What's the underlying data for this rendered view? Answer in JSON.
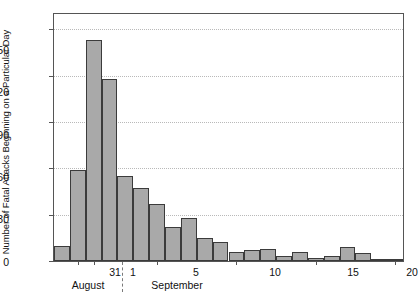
{
  "chart_data": {
    "type": "bar",
    "title": "",
    "subtitle": "",
    "xlabel": "",
    "ylabel": "Number of Fatal Attacks Beginning on a Particular Day",
    "ylim": [
      0,
      160
    ],
    "xlim": [
      0,
      21
    ],
    "grid": true,
    "legend": null,
    "yticks": [
      0,
      30,
      60,
      90,
      120,
      150
    ],
    "ytick_labels": [
      "0",
      "30",
      "60",
      "90",
      "120",
      "150"
    ],
    "xticks": [
      1,
      5,
      10,
      15,
      20
    ],
    "xtick_labels": [
      "1",
      "5",
      "10",
      "15",
      "20"
    ],
    "extra_xtick": {
      "value": 0,
      "label": "31"
    },
    "month_bands": [
      {
        "label": "August",
        "center_day": -0.6
      },
      {
        "label": "September",
        "center_day": 3.4
      }
    ],
    "bar_color": "#a9a9a9",
    "bar_edge_color": "#3b3b3b",
    "annotations": [
      {
        "text": "Pump handle removed",
        "day": 8,
        "leader_from_day": 8.6,
        "leader_to_day": 7.9
      }
    ],
    "categories": [
      "Aug 30",
      "Aug 31",
      "Sep 1",
      "Sep 2",
      "Sep 3",
      "Sep 4",
      "Sep 5",
      "Sep 6",
      "Sep 7",
      "Sep 8",
      "Sep 9",
      "Sep 10",
      "Sep 11",
      "Sep 12",
      "Sep 13",
      "Sep 14",
      "Sep 15",
      "Sep 16",
      "Sep 17",
      "Sep 18",
      "Sep 19",
      "Sep 20"
    ],
    "x": [
      -1,
      0,
      1,
      2,
      3,
      4,
      5,
      6,
      7,
      8,
      9,
      10,
      11,
      12,
      13,
      14,
      15,
      16,
      17,
      18,
      19,
      20
    ],
    "values": [
      10,
      59,
      143,
      118,
      55,
      47,
      37,
      22,
      28,
      15,
      12,
      6,
      7,
      8,
      3,
      6,
      2,
      3,
      9,
      5,
      1,
      1
    ]
  },
  "figure": {
    "ytitle": "Number of Fatal Attacks Beginning on a Particular Day",
    "annotation": "Pump handle removed",
    "month_august": "August",
    "month_september": "September",
    "tick_31": "31",
    "tick_1": "1",
    "tick_5": "5",
    "tick_10": "10",
    "tick_15": "15",
    "tick_20": "20",
    "y_0": "0",
    "y_30": "30",
    "y_60": "60",
    "y_90": "90",
    "y_120": "120",
    "y_150": "150"
  }
}
